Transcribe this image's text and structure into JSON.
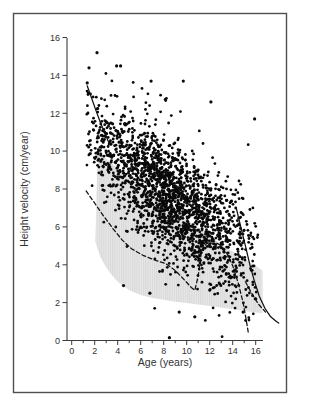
{
  "figure": {
    "background": "#ffffff",
    "frame_color": "#4f4f4f"
  },
  "chart_data": {
    "type": "scatter",
    "title": "",
    "xlabel": "Age (years)",
    "ylabel": "Height velocity (cm/year)",
    "xlim": [
      0,
      16
    ],
    "ylim": [
      0,
      16
    ],
    "x_major_ticks": [
      0,
      2,
      4,
      6,
      8,
      10,
      12,
      14,
      16
    ],
    "x_minor_ticks": [
      1,
      3,
      5,
      7,
      9,
      11,
      13,
      15
    ],
    "y_major_ticks": [
      0,
      2,
      4,
      6,
      8,
      10,
      12,
      14,
      16
    ],
    "grid": false,
    "legend": "none",
    "colors": {
      "dots": "#0a0a0a",
      "curves": "#111111",
      "band_stripe_dark": "#d9d9d9",
      "band_stripe_light": "#e7e7e7",
      "axis": "#3c3c3c",
      "text": "#333333"
    },
    "reference_band": {
      "description": "gray hatched normal reference range",
      "top_edge": [
        [
          2.3,
          10.05
        ],
        [
          3.0,
          9.6
        ],
        [
          4.0,
          9.1
        ],
        [
          5.0,
          8.65
        ],
        [
          6.0,
          8.2
        ],
        [
          7.0,
          7.75
        ],
        [
          8.0,
          7.3
        ],
        [
          9.0,
          6.85
        ],
        [
          10.0,
          6.4
        ],
        [
          11.0,
          5.95
        ],
        [
          12.0,
          5.5
        ],
        [
          13.0,
          5.1
        ],
        [
          14.0,
          4.7
        ],
        [
          15.0,
          4.3
        ],
        [
          16.0,
          3.95
        ],
        [
          16.6,
          3.7
        ]
      ],
      "bottom_edge": [
        [
          2.05,
          5.2
        ],
        [
          2.5,
          4.4
        ],
        [
          3.0,
          3.85
        ],
        [
          3.5,
          3.45
        ],
        [
          4.0,
          3.1
        ],
        [
          5.0,
          2.65
        ],
        [
          6.0,
          2.4
        ],
        [
          7.0,
          2.25
        ],
        [
          8.0,
          2.15
        ],
        [
          9.0,
          2.05
        ],
        [
          10.0,
          1.98
        ],
        [
          11.0,
          1.9
        ],
        [
          12.0,
          1.82
        ],
        [
          13.0,
          1.74
        ],
        [
          14.0,
          1.65
        ],
        [
          15.0,
          1.56
        ],
        [
          16.0,
          1.48
        ],
        [
          16.6,
          1.44
        ]
      ],
      "left_edge": [
        [
          2.05,
          5.2
        ],
        [
          2.1,
          6.3
        ],
        [
          2.15,
          7.5
        ],
        [
          2.2,
          8.6
        ],
        [
          2.25,
          9.4
        ],
        [
          2.3,
          10.05
        ]
      ]
    },
    "curves": [
      {
        "name": "early-childhood-solid-curve",
        "style": "solid",
        "points": [
          [
            1.35,
            13.45
          ],
          [
            1.7,
            12.85
          ],
          [
            2.1,
            12.15
          ],
          [
            2.5,
            11.5
          ],
          [
            2.9,
            10.9
          ],
          [
            3.3,
            10.35
          ]
        ]
      },
      {
        "name": "lower-limit-dashed-curve",
        "style": "dashed",
        "points": [
          [
            1.25,
            7.9
          ],
          [
            2.0,
            7.25
          ],
          [
            2.8,
            6.55
          ],
          [
            3.6,
            5.9
          ],
          [
            4.4,
            5.3
          ],
          [
            5.2,
            4.85
          ],
          [
            6.2,
            4.5
          ],
          [
            7.2,
            4.25
          ],
          [
            8.2,
            4.05
          ],
          [
            9.0,
            3.7
          ],
          [
            9.8,
            3.2
          ],
          [
            10.4,
            2.8
          ],
          [
            10.7,
            2.65
          ],
          [
            11.0,
            3.4
          ],
          [
            11.3,
            4.8
          ],
          [
            11.7,
            5.1
          ],
          [
            12.3,
            5.25
          ],
          [
            12.9,
            5.05
          ],
          [
            13.5,
            4.6
          ],
          [
            14.0,
            3.95
          ],
          [
            14.5,
            3.0
          ],
          [
            14.9,
            2.0
          ],
          [
            15.2,
            1.0
          ],
          [
            15.35,
            0.45
          ]
        ]
      },
      {
        "name": "late-dashed-curve",
        "style": "dashed",
        "points": [
          [
            15.1,
            3.1
          ],
          [
            15.6,
            2.55
          ],
          [
            16.2,
            1.95
          ],
          [
            16.85,
            1.5
          ]
        ]
      },
      {
        "name": "pubertal-solid-curve",
        "style": "solid",
        "points": [
          [
            14.3,
            7.0
          ],
          [
            14.7,
            6.0
          ],
          [
            15.1,
            5.0
          ],
          [
            15.5,
            4.0
          ],
          [
            15.9,
            3.1
          ],
          [
            16.3,
            2.35
          ],
          [
            16.8,
            1.7
          ],
          [
            17.3,
            1.25
          ],
          [
            17.8,
            1.0
          ],
          [
            18.0,
            0.92
          ]
        ]
      }
    ],
    "scatter": {
      "n_points": 2100,
      "seed": 1337,
      "dot_radius": 1.4,
      "age_range": [
        1.3,
        16.2
      ],
      "mean_intercept": 11.6,
      "mean_slope": -0.47,
      "sd": 1.55,
      "sd_young": 1.15,
      "young_age_cutoff": 2.6,
      "uniform_mix": 0.18,
      "v_clamp": [
        0.15,
        15.3
      ],
      "outliers": [
        [
          2.2,
          15.2
        ],
        [
          1.5,
          14.4
        ],
        [
          3.9,
          14.5
        ],
        [
          4.25,
          14.5
        ],
        [
          1.35,
          13.6
        ],
        [
          6.9,
          13.7
        ],
        [
          9.7,
          13.7
        ],
        [
          12.1,
          12.6
        ],
        [
          15.9,
          11.7
        ],
        [
          8.5,
          0.15
        ],
        [
          9.35,
          1.5
        ],
        [
          10.7,
          1.25
        ],
        [
          4.5,
          2.9
        ],
        [
          6.8,
          2.5
        ],
        [
          14.9,
          1.5
        ],
        [
          16.0,
          2.2
        ]
      ]
    }
  }
}
